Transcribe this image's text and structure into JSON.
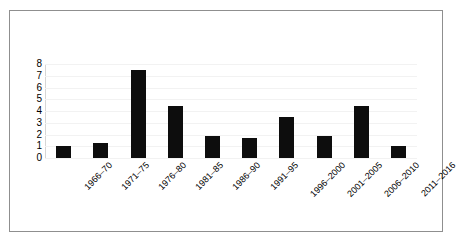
{
  "chart_data": {
    "type": "bar",
    "title": "",
    "subtitle": "",
    "xlabel": "",
    "ylabel": "",
    "categories": [
      "1966–70",
      "1971–75",
      "1976–80",
      "1981–85",
      "1986–90",
      "1991–95",
      "1996–2000",
      "2001–2005",
      "2006–2010",
      "2011–2016"
    ],
    "values": [
      1,
      1.3,
      7.5,
      4.4,
      1.9,
      1.7,
      3.5,
      1.9,
      4.4,
      1
    ],
    "ylim": [
      0,
      8
    ],
    "ytick_labels": [
      "8",
      "7",
      "6",
      "5",
      "4",
      "3",
      "2",
      "1",
      "0"
    ],
    "ytick_values": [
      8,
      7,
      6,
      5,
      4,
      3,
      2,
      1,
      0
    ],
    "grid": true,
    "legend": false,
    "legend_position": "none",
    "bar_color": "#0d0d0d",
    "gridline_color": "#f2f2f2",
    "frame_color": "#8f8f8f",
    "background_color": "#ffffff",
    "xlabel_rotation": -45
  }
}
